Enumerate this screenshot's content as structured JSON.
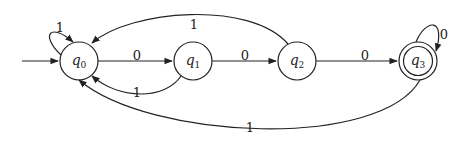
{
  "diagram": {
    "type": "finite-automaton",
    "colors": {
      "stroke": "#222222",
      "background": "#ffffff"
    },
    "start_state": "q0",
    "accept_states": [
      "q3"
    ],
    "states": [
      {
        "id": "q0",
        "label_base": "q",
        "label_sub": "0",
        "x": 79,
        "y": 61,
        "accepting": false
      },
      {
        "id": "q1",
        "label_base": "q",
        "label_sub": "1",
        "x": 193,
        "y": 61,
        "accepting": false
      },
      {
        "id": "q2",
        "label_base": "q",
        "label_sub": "2",
        "x": 297,
        "y": 61,
        "accepting": false
      },
      {
        "id": "q3",
        "label_base": "q",
        "label_sub": "3",
        "x": 418,
        "y": 61,
        "accepting": true
      }
    ],
    "transitions": [
      {
        "from": "q0",
        "to": "q0",
        "symbol": "1"
      },
      {
        "from": "q0",
        "to": "q1",
        "symbol": "0"
      },
      {
        "from": "q1",
        "to": "q0",
        "symbol": "1"
      },
      {
        "from": "q1",
        "to": "q2",
        "symbol": "0"
      },
      {
        "from": "q2",
        "to": "q0",
        "symbol": "1"
      },
      {
        "from": "q2",
        "to": "q3",
        "symbol": "0"
      },
      {
        "from": "q3",
        "to": "q3",
        "symbol": "0"
      },
      {
        "from": "q3",
        "to": "q0",
        "symbol": "1"
      }
    ]
  }
}
